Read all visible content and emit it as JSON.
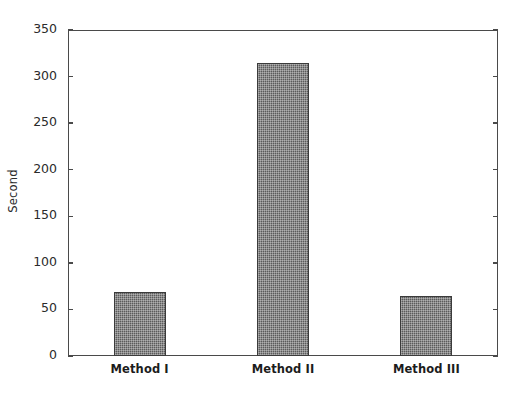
{
  "chart_data": {
    "type": "bar",
    "title": "",
    "xlabel": "",
    "ylabel": "Second",
    "categories": [
      "Method I",
      "Method II",
      "Method III"
    ],
    "values": [
      69,
      315,
      64
    ],
    "ylim": [
      0,
      350
    ],
    "yticks": [
      0,
      50,
      100,
      150,
      200,
      250,
      300,
      350
    ],
    "ytick_labels": [
      "0",
      "50",
      "100",
      "150",
      "200",
      "250",
      "300",
      "350"
    ],
    "grid": false,
    "legend": null,
    "bar_fill_color": "#5b5b5b",
    "bar_edge_color": "#3b3b3b",
    "axis_color": "#4a4a4a",
    "background_color": "#ffffff",
    "text_color": "#2b2b2b"
  }
}
